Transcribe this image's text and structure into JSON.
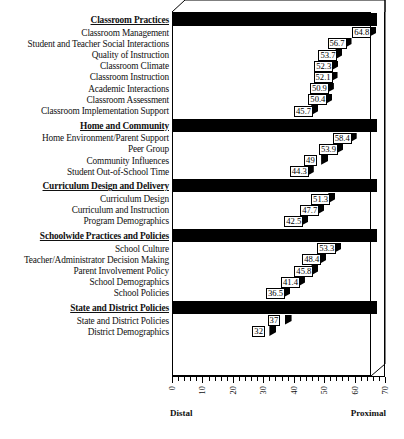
{
  "chart_data": {
    "type": "bar",
    "orientation": "horizontal",
    "title": "",
    "xlabel": "T-Scores",
    "ylabel": "",
    "xlim": [
      0,
      70
    ],
    "xticks": [
      0,
      10,
      20,
      30,
      40,
      50,
      60,
      70
    ],
    "xtick_labels": [
      "0",
      "10",
      "20",
      "30",
      "40",
      "50",
      "60",
      "70"
    ],
    "axis_left_annotation": "Distal",
    "axis_right_annotation": "Proximal",
    "grid": false,
    "legend": "none",
    "groups": [
      {
        "name": "Classroom Practices",
        "items": [
          {
            "label": "Classroom Management",
            "value": 64.8
          },
          {
            "label": "Student and Teacher Social Interactions",
            "value": 56.7
          },
          {
            "label": "Quality of Instruction",
            "value": 53.7
          },
          {
            "label": "Classroom Climate",
            "value": 52.3
          },
          {
            "label": "Classroom Instruction",
            "value": 52.1
          },
          {
            "label": "Academic Interactions",
            "value": 50.9
          },
          {
            "label": "Classroom Assessment",
            "value": 50.4
          },
          {
            "label": "Classroom Implementation Support",
            "value": 45.7
          }
        ]
      },
      {
        "name": "Home and Community",
        "items": [
          {
            "label": "Home Environment/Parent Support",
            "value": 58.4
          },
          {
            "label": "Peer Group",
            "value": 53.9
          },
          {
            "label": "Community Influences",
            "value": 49
          },
          {
            "label": "Student Out-of-School Time",
            "value": 44.3
          }
        ]
      },
      {
        "name": "Curriculum Design and Delivery",
        "items": [
          {
            "label": "Curriculum Design",
            "value": 51.3
          },
          {
            "label": "Curriculum and Instruction",
            "value": 47.7
          },
          {
            "label": "Program Demographics",
            "value": 42.5
          }
        ]
      },
      {
        "name": "Schoolwide Practices and Policies",
        "items": [
          {
            "label": "School Culture",
            "value": 53.3
          },
          {
            "label": "Teacher/Administrator Decision Making",
            "value": 48.4
          },
          {
            "label": "Parent Involvement Policy",
            "value": 45.8
          },
          {
            "label": "School Demographics",
            "value": 41.4
          },
          {
            "label": "School Policies",
            "value": 36.5
          }
        ]
      },
      {
        "name": "State and District Policies",
        "items": [
          {
            "label": "State and District Policies",
            "value": 37
          },
          {
            "label": "District Demographics",
            "value": 32
          }
        ]
      }
    ]
  },
  "colors": {
    "bar": "#111111",
    "bar_stripe": "#555555",
    "frame": "#000000",
    "background": "#ffffff",
    "text": "#111111"
  }
}
